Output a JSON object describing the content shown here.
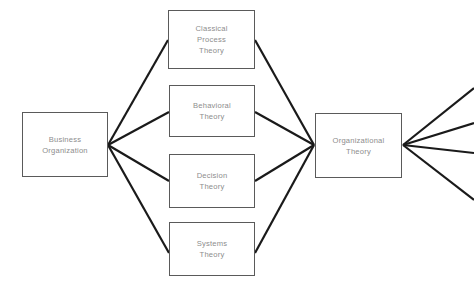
{
  "diagram": {
    "type": "flow-diagram",
    "background_color": "#ffffff",
    "box_border_color": "#5a5a5a",
    "edge_color": "#1a1a1a",
    "label_color": "#8d8d8d",
    "canvas": {
      "width": 474,
      "height": 298
    }
  },
  "nodes": [
    {
      "id": "business-organization",
      "label": "Business\nOrganization",
      "x": 22,
      "y": 112,
      "width": 86,
      "height": 65
    },
    {
      "id": "classical-process-theory",
      "label": "Classical\nProcess\nTheory",
      "x": 168,
      "y": 10,
      "width": 87,
      "height": 59
    },
    {
      "id": "behavioral-theory",
      "label": "Behavioral\nTheory",
      "x": 169,
      "y": 85,
      "width": 86,
      "height": 52
    },
    {
      "id": "decision-theory",
      "label": "Decision\nTheory",
      "x": 169,
      "y": 154,
      "width": 86,
      "height": 54
    },
    {
      "id": "systems-theory",
      "label": "Systems\nTheory",
      "x": 169,
      "y": 222,
      "width": 86,
      "height": 54
    },
    {
      "id": "organizational-theory",
      "label": "Organizational\nTheory",
      "x": 315,
      "y": 113,
      "width": 87,
      "height": 65
    }
  ],
  "edges": [
    {
      "id": "bo-to-classical",
      "from": "business-organization",
      "to": "classical-process-theory",
      "x1": 108,
      "y1": 145,
      "x2": 168,
      "y2": 40
    },
    {
      "id": "bo-to-behavioral",
      "from": "business-organization",
      "to": "behavioral-theory",
      "x1": 108,
      "y1": 145,
      "x2": 169,
      "y2": 112
    },
    {
      "id": "bo-to-decision",
      "from": "business-organization",
      "to": "decision-theory",
      "x1": 108,
      "y1": 145,
      "x2": 169,
      "y2": 181
    },
    {
      "id": "bo-to-systems",
      "from": "business-organization",
      "to": "systems-theory",
      "x1": 108,
      "y1": 145,
      "x2": 169,
      "y2": 253
    },
    {
      "id": "classical-to-org",
      "from": "classical-process-theory",
      "to": "organizational-theory",
      "x1": 255,
      "y1": 40,
      "x2": 314,
      "y2": 145
    },
    {
      "id": "behavioral-to-org",
      "from": "behavioral-theory",
      "to": "organizational-theory",
      "x1": 255,
      "y1": 112,
      "x2": 314,
      "y2": 145
    },
    {
      "id": "decision-to-org",
      "from": "decision-theory",
      "to": "organizational-theory",
      "x1": 255,
      "y1": 181,
      "x2": 314,
      "y2": 145
    },
    {
      "id": "systems-to-org",
      "from": "systems-theory",
      "to": "organizational-theory",
      "x1": 255,
      "y1": 253,
      "x2": 314,
      "y2": 145
    },
    {
      "id": "org-out-1",
      "from": "organizational-theory",
      "to": "offscreen-1",
      "x1": 403,
      "y1": 145,
      "x2": 474,
      "y2": 88
    },
    {
      "id": "org-out-2",
      "from": "organizational-theory",
      "to": "offscreen-2",
      "x1": 403,
      "y1": 145,
      "x2": 474,
      "y2": 123
    },
    {
      "id": "org-out-3",
      "from": "organizational-theory",
      "to": "offscreen-3",
      "x1": 403,
      "y1": 145,
      "x2": 474,
      "y2": 153
    },
    {
      "id": "org-out-4",
      "from": "organizational-theory",
      "to": "offscreen-4",
      "x1": 403,
      "y1": 145,
      "x2": 474,
      "y2": 200
    }
  ]
}
